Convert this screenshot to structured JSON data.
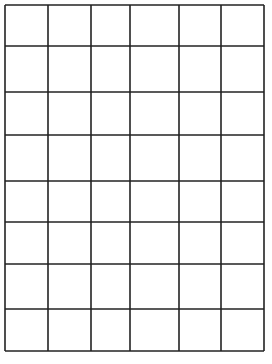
{
  "grid": {
    "columns": 6,
    "rows": 8,
    "line_color": "#222222",
    "background": "#ffffff",
    "line_width": 1.6,
    "x_lines": [
      5,
      48,
      91,
      130,
      179,
      221,
      264
    ],
    "y_lines": [
      5,
      46,
      92,
      135,
      181,
      222,
      264,
      309,
      351
    ]
  }
}
